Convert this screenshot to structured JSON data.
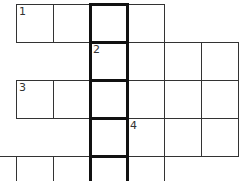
{
  "puzzle": {
    "cells": [
      {
        "r": 0,
        "c": 1,
        "num": "1"
      },
      {
        "r": 0,
        "c": 2
      },
      {
        "r": 0,
        "c": 3
      },
      {
        "r": 0,
        "c": 4
      },
      {
        "r": 1,
        "c": 3,
        "num": "2"
      },
      {
        "r": 1,
        "c": 4
      },
      {
        "r": 1,
        "c": 5
      },
      {
        "r": 1,
        "c": 6
      },
      {
        "r": 2,
        "c": 1,
        "num": "3"
      },
      {
        "r": 2,
        "c": 2
      },
      {
        "r": 2,
        "c": 3
      },
      {
        "r": 2,
        "c": 4
      },
      {
        "r": 2,
        "c": 5
      },
      {
        "r": 2,
        "c": 6
      },
      {
        "r": 3,
        "c": 3
      },
      {
        "r": 3,
        "c": 4,
        "num": "4"
      },
      {
        "r": 3,
        "c": 5
      },
      {
        "r": 3,
        "c": 6
      },
      {
        "r": 4,
        "c": 0
      },
      {
        "r": 4,
        "c": 1
      },
      {
        "r": 4,
        "c": 2
      },
      {
        "r": 4,
        "c": 3
      },
      {
        "r": 4,
        "c": 4
      }
    ],
    "highlight_column": 3,
    "colors": {
      "line": "#333333",
      "bold": "#111111",
      "bg": "#ffffff"
    }
  }
}
